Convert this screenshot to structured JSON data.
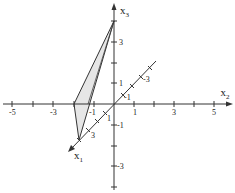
{
  "diagram": {
    "type": "3d-coordinate-system",
    "axes": {
      "x1": {
        "label": "x",
        "subscript": "1",
        "tick_labels": [
          "1",
          "3",
          "-1",
          "-3"
        ]
      },
      "x2": {
        "label": "x",
        "subscript": "2",
        "tick_labels": [
          "-5",
          "-3",
          "-1",
          "1",
          "3",
          "5"
        ]
      },
      "x3": {
        "label": "x",
        "subscript": "3",
        "tick_labels": [
          "3",
          "1",
          "-1",
          "-3"
        ]
      }
    },
    "triangle": {
      "vertices": [
        {
          "name": "A",
          "coords": [
            4,
            0,
            0
          ]
        },
        {
          "name": "B",
          "coords": [
            0,
            -2,
            0
          ]
        },
        {
          "name": "C",
          "coords": [
            0,
            0,
            4
          ]
        }
      ],
      "fill": "#e6e6e6",
      "stroke": "#333333"
    },
    "colors": {
      "axis": "#333333",
      "fill": "#e6e6e6"
    }
  }
}
